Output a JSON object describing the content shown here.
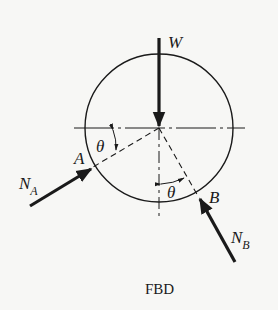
{
  "diagram": {
    "type": "free-body-diagram",
    "caption": "FBD",
    "body": "circle",
    "forces": [
      {
        "id": "W",
        "label": "W",
        "direction": "downward",
        "applied_at": "center"
      },
      {
        "id": "NA",
        "label": "N",
        "subscript": "A",
        "direction": "toward center",
        "applied_at": "A"
      },
      {
        "id": "NB",
        "label": "N",
        "subscript": "B",
        "direction": "toward center",
        "applied_at": "B"
      }
    ],
    "points": [
      {
        "id": "A",
        "label": "A"
      },
      {
        "id": "B",
        "label": "B"
      }
    ],
    "angles": [
      {
        "id": "theta_A",
        "label": "θ",
        "between": "horizontal centerline and radius to A"
      },
      {
        "id": "theta_B",
        "label": "θ",
        "between": "vertical centerline and radius to B"
      }
    ],
    "colors": {
      "ink": "#1a1a1a",
      "background": "#f7f7f5"
    }
  }
}
